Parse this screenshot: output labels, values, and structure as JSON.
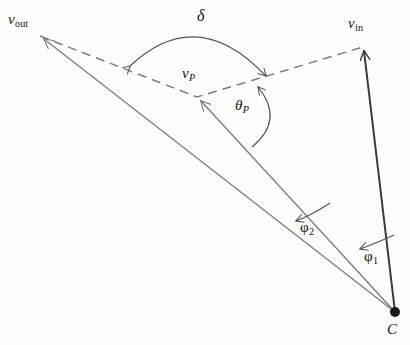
{
  "figure": {
    "background_color": "#fdfdfc",
    "vector_color_primary": "#3a3a3a",
    "vector_color_secondary": "#7d7d7d",
    "dash_color": "#7d7d7d",
    "arc_color": "#555555",
    "label_color": "#111111"
  },
  "labels": {
    "v_out": {
      "base": "v",
      "sub": "out"
    },
    "v_in": {
      "base": "v",
      "sub": "in"
    },
    "v_p": {
      "base": "v",
      "sub": "P"
    },
    "delta": {
      "glyph": "δ"
    },
    "theta_p": {
      "glyph": "θ",
      "sub": "P"
    },
    "phi_2": {
      "glyph": "φ",
      "sub": "2"
    },
    "phi_1": {
      "glyph": "φ",
      "sub": "1"
    },
    "center": {
      "glyph": "C"
    }
  },
  "geometry": {
    "origin_point": {
      "name": "C",
      "x": 395,
      "y": 312,
      "dot_radius": 5
    },
    "vectors": [
      {
        "name": "v_in",
        "from": [
          395,
          312
        ],
        "to": [
          363,
          47
        ],
        "style": "solid",
        "weight": 2.0,
        "color": "#3a3a3a",
        "arrow": "head"
      },
      {
        "name": "v_out",
        "from": [
          395,
          312
        ],
        "to": [
          40,
          36
        ],
        "style": "solid",
        "weight": 1.3,
        "color": "#7d7d7d",
        "arrow": "head"
      },
      {
        "name": "v_p",
        "from": [
          395,
          312
        ],
        "to": [
          197,
          97
        ],
        "style": "solid",
        "weight": 1.3,
        "color": "#7d7d7d",
        "arrow": "head"
      }
    ],
    "dashed_polyline": {
      "name": "chord-vout-vp-vin",
      "points": [
        [
          40,
          36
        ],
        [
          197,
          97
        ],
        [
          363,
          47
        ]
      ],
      "dash_pattern": "9 6"
    },
    "arcs": [
      {
        "name": "delta-arc",
        "path": "M 128 70 Q 196 2 267 80",
        "arrows": "both",
        "label": "delta"
      },
      {
        "name": "theta-p-arc",
        "path": "M 258 84 Q 284 120 250 149",
        "arrows": "start",
        "label": "theta_p"
      },
      {
        "name": "phi2-arc",
        "path": "M 294 223 Q 313 216 325 207",
        "arrows": "start",
        "label": "phi_2"
      },
      {
        "name": "phi1-arc",
        "path": "M 357 250 Q 380 243 392 238",
        "arrows": "start",
        "label": "phi_1"
      }
    ]
  }
}
